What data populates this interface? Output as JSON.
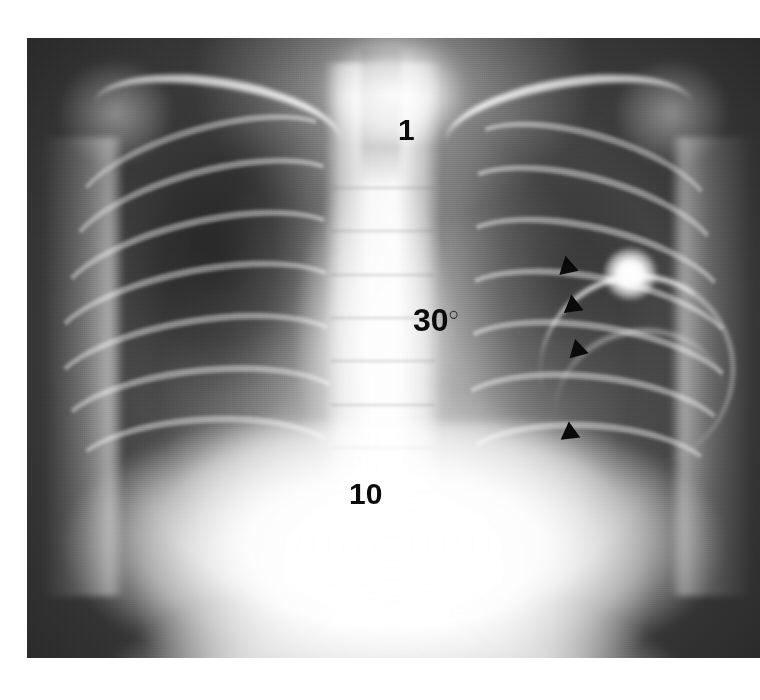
{
  "figure": {
    "modality": "chest-radiograph",
    "view": "frontal-ap",
    "background_color": "#ffffff",
    "plate": {
      "left": 27,
      "top": 38,
      "width": 733,
      "height": 620,
      "border_color": "#3a3a3a"
    }
  },
  "annotations": {
    "rib_one": {
      "text": "1",
      "name": "first-rib-label",
      "color": "#0b0b0b",
      "x": 398,
      "y": 115
    },
    "rib_ten": {
      "text": "10",
      "name": "tenth-rib-label",
      "color": "#0b0b0b",
      "x": 349,
      "y": 479
    },
    "angle": {
      "value": "30",
      "degree_symbol": "○",
      "text": "30°",
      "name": "angle-label",
      "color": "#0b0b0b",
      "x": 413,
      "y": 304
    }
  },
  "markers": {
    "label": "arrowheads",
    "count": 4,
    "color": "#0a0a0a",
    "direction": "right",
    "items": [
      {
        "id": "arrowhead-1",
        "x": 562,
        "y": 258,
        "rotation": 18
      },
      {
        "id": "arrowhead-2",
        "x": 567,
        "y": 297,
        "rotation": 22
      },
      {
        "id": "arrowhead-3",
        "x": 572,
        "y": 341,
        "rotation": 16
      },
      {
        "id": "arrowhead-4",
        "x": 564,
        "y": 424,
        "rotation": 24
      }
    ]
  },
  "anatomy": {
    "lung_right": "right lung field",
    "lung_left": "left lung field",
    "spine": "thoracic spine",
    "mediastinum": "mediastinum",
    "trachea": "trachea",
    "clavicle_left": "left clavicle",
    "clavicle_right": "right clavicle",
    "diaphragm": "diaphragm",
    "opacity": "focal opacity"
  },
  "caption": {
    "sliver_text": ""
  }
}
